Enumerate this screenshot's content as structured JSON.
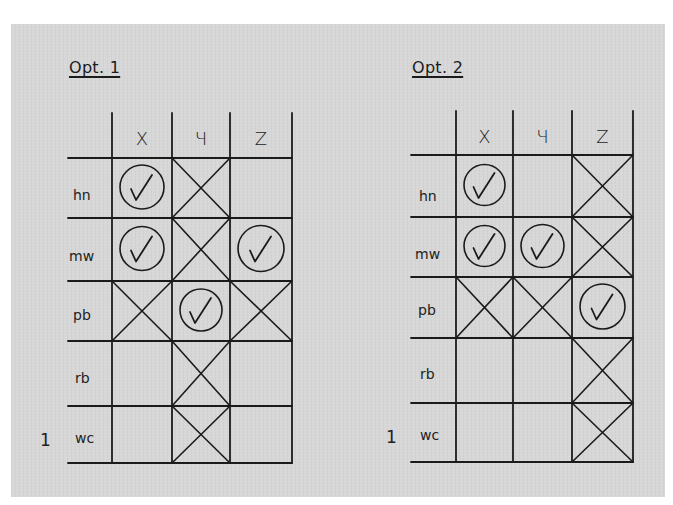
{
  "options": [
    {
      "title": "Opt. 1",
      "columns": [
        "X",
        "Y",
        "Z"
      ],
      "column_glyphs": [
        "X",
        "Ч",
        "Z"
      ],
      "rows": [
        {
          "label": "hn",
          "cells": [
            "check",
            "cross",
            "empty"
          ]
        },
        {
          "label": "mw",
          "cells": [
            "check",
            "cross",
            "check"
          ]
        },
        {
          "label": "pb",
          "cells": [
            "cross",
            "check",
            "cross"
          ]
        },
        {
          "label": "rb",
          "cells": [
            "empty",
            "cross",
            "empty"
          ]
        },
        {
          "label": "wc",
          "cells": [
            "empty",
            "cross",
            "empty"
          ]
        }
      ],
      "side_marker": "1"
    },
    {
      "title": "Opt. 2",
      "columns": [
        "X",
        "Y",
        "Z"
      ],
      "column_glyphs": [
        "X",
        "Ч",
        "Z"
      ],
      "rows": [
        {
          "label": "hn",
          "cells": [
            "check",
            "empty",
            "cross"
          ]
        },
        {
          "label": "mw",
          "cells": [
            "check",
            "check",
            "cross"
          ]
        },
        {
          "label": "pb",
          "cells": [
            "cross",
            "cross",
            "check"
          ]
        },
        {
          "label": "rb",
          "cells": [
            "empty",
            "empty",
            "cross"
          ]
        },
        {
          "label": "wc",
          "cells": [
            "empty",
            "empty",
            "cross"
          ]
        }
      ],
      "side_marker": "1"
    }
  ],
  "colors": {
    "background": "#d7d7d7",
    "ink": "#1b1b1b"
  }
}
